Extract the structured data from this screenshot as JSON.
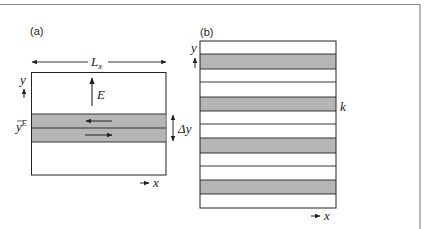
{
  "figure": {
    "colors": {
      "band": "#b5b5b5",
      "line": "#222222",
      "frame": "#888888",
      "background": "#ffffff"
    },
    "panel_a": {
      "label": "(a)",
      "width_label": "L",
      "width_label_sub": "x",
      "field_label": "E",
      "y_axis_label": "y",
      "x_axis_label": "x",
      "band_position_label": "y",
      "band_position_sup": "E",
      "band_height_label": "Δy",
      "arrows": [
        "upper band flow to left",
        "lower band flow to right"
      ]
    },
    "panel_b": {
      "label": "(b)",
      "y_axis_label": "y",
      "x_axis_label": "x",
      "side_label": "k",
      "stripe_count": 4
    }
  }
}
